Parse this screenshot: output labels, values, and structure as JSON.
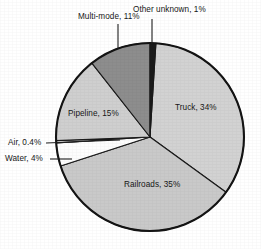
{
  "chart_data": {
    "type": "pie",
    "title": "",
    "subtitle": "",
    "xlabel": "",
    "ylabel": "",
    "legend_position": "none",
    "grid": false,
    "units": "percent",
    "total": 100,
    "start_angle_deg": 0,
    "direction": "clockwise",
    "categories": [
      "Other unknown",
      "Truck",
      "Railroads",
      "Water",
      "Air",
      "Pipeline",
      "Multi-mode"
    ],
    "values": [
      1,
      34,
      35,
      4,
      0.4,
      15,
      11
    ],
    "colors": [
      "#1b1b1b",
      "#d2d2d2",
      "#c9c9c9",
      "#fdfdfd",
      "#f4f4f4",
      "#cfcfcf",
      "#8d8d8d"
    ],
    "slices": [
      {
        "name": "Other unknown",
        "label": "Other unknown, 1%",
        "value": 1,
        "value_text": "1%",
        "color": "#1b1b1b",
        "label_placement": "outside-leader",
        "start_deg": 0,
        "end_deg": 3.6
      },
      {
        "name": "Truck",
        "label": "Truck, 34%",
        "value": 34,
        "value_text": "34%",
        "color": "#d2d2d2",
        "label_placement": "inside",
        "start_deg": 3.6,
        "end_deg": 126.0
      },
      {
        "name": "Railroads",
        "label": "Railroads, 35%",
        "value": 35,
        "value_text": "35%",
        "color": "#c9c9c9",
        "label_placement": "inside",
        "start_deg": 126.0,
        "end_deg": 252.0
      },
      {
        "name": "Water",
        "label": "Water, 4%",
        "value": 4,
        "value_text": "4%",
        "color": "#fdfdfd",
        "label_placement": "outside-leader",
        "start_deg": 252.0,
        "end_deg": 266.4
      },
      {
        "name": "Air",
        "label": "Air, 0.4%",
        "value": 0.4,
        "value_text": "0.4%",
        "color": "#f4f4f4",
        "label_placement": "outside-leader",
        "start_deg": 266.4,
        "end_deg": 267.8
      },
      {
        "name": "Pipeline",
        "label": "Pipeline, 15%",
        "value": 15,
        "value_text": "15%",
        "color": "#cfcfcf",
        "label_placement": "inside",
        "start_deg": 267.8,
        "end_deg": 321.8
      },
      {
        "name": "Multi-mode",
        "label": "Multi-mode, 11%",
        "value": 11,
        "value_text": "11%",
        "color": "#8d8d8d",
        "label_placement": "outside-leader",
        "start_deg": 321.8,
        "end_deg": 360.0
      }
    ]
  },
  "labels": {
    "other_unknown": "Other unknown, 1%",
    "multi_mode": "Multi-mode, 11%",
    "truck": "Truck, 34%",
    "railroads": "Railroads, 35%",
    "pipeline": "Pipeline, 15%",
    "air": "Air, 0.4%",
    "water": "Water, 4%"
  }
}
